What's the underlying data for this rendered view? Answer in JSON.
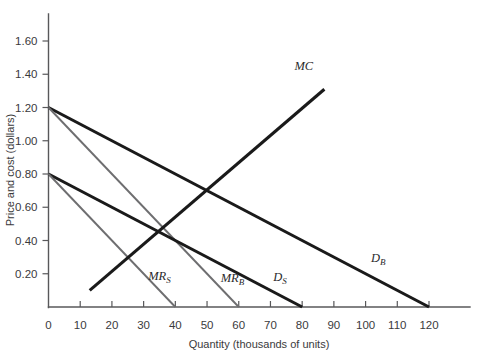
{
  "chart_data": {
    "type": "line",
    "title": "",
    "xlabel": "Quantity (thousands of units)",
    "ylabel": "Price and cost (dollars)",
    "xlim": [
      0,
      120
    ],
    "ylim": [
      0,
      1.6
    ],
    "grid": false,
    "legend_position": "inline-curve-labels",
    "x_ticks": [
      "0",
      "10",
      "20",
      "30",
      "40",
      "50",
      "60",
      "70",
      "80",
      "90",
      "100",
      "110",
      "120"
    ],
    "x_tick_values": [
      0,
      10,
      20,
      30,
      40,
      50,
      60,
      70,
      80,
      90,
      100,
      110,
      120
    ],
    "y_ticks": [
      "0.20",
      "0.40",
      "0.60",
      "0.80",
      "1.00",
      "1.20",
      "1.40",
      "1.60"
    ],
    "y_tick_values": [
      0.2,
      0.4,
      0.6,
      0.8,
      1.0,
      1.2,
      1.4,
      1.6
    ],
    "series": [
      {
        "name": "D_B",
        "label_text": "D",
        "label_sub": "B",
        "style": "demand",
        "color": "#1a1a1a",
        "x": [
          0,
          120
        ],
        "values": [
          1.2,
          0.0
        ],
        "label_x": 104,
        "label_y": 0.27
      },
      {
        "name": "MR_B",
        "label_text": "MR",
        "label_sub": "B",
        "style": "marginal-revenue",
        "color": "#6e6e70",
        "x": [
          0,
          60
        ],
        "values": [
          1.2,
          0.0
        ],
        "label_x": 58,
        "label_y": 0.15
      },
      {
        "name": "D_S",
        "label_text": "D",
        "label_sub": "S",
        "style": "demand",
        "color": "#1a1a1a",
        "x": [
          0,
          80
        ],
        "values": [
          0.8,
          0.0
        ],
        "label_x": 73,
        "label_y": 0.155
      },
      {
        "name": "MR_S",
        "label_text": "MR",
        "label_sub": "S",
        "style": "marginal-revenue",
        "color": "#6e6e70",
        "x": [
          0,
          40
        ],
        "values": [
          0.8,
          0.0
        ],
        "label_x": 35,
        "label_y": 0.16
      },
      {
        "name": "MC",
        "label_text": "MC",
        "label_sub": "",
        "style": "marginal-cost",
        "color": "#1a1a1a",
        "x": [
          13,
          87
        ],
        "values": [
          0.1,
          1.31
        ],
        "label_x": 80.5,
        "label_y": 1.425
      }
    ]
  },
  "axes": {
    "x_axis_title": "Quantity (thousands of units)",
    "y_axis_title": "Price and cost (dollars)",
    "origin_label": "0"
  }
}
